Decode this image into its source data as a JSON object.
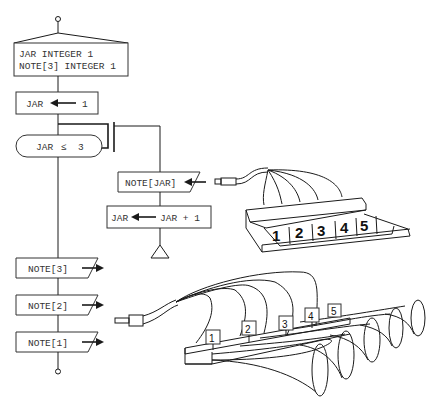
{
  "flowchart": {
    "declaration": {
      "line1": "JAR INTEGER 1",
      "line2": "NOTE[3] INTEGER 1"
    },
    "init": {
      "lhs": "JAR",
      "rhs": "1"
    },
    "loop_condition": {
      "lhs": "JAR",
      "op": "≤",
      "rhs": "3"
    },
    "input": {
      "label": "NOTE[JAR]"
    },
    "increment": {
      "lhs": "JAR",
      "rhs": "JAR + 1"
    },
    "outputs": [
      {
        "label": "NOTE[3]"
      },
      {
        "label": "NOTE[2]"
      },
      {
        "label": "NOTE[1]"
      }
    ]
  },
  "keypad": {
    "keys": [
      "1",
      "2",
      "3",
      "4",
      "5"
    ]
  },
  "horns": {
    "labels": [
      "1",
      "2",
      "3",
      "4",
      "5"
    ]
  },
  "colors": {
    "ink": "#1a1a1a",
    "text": "#333333",
    "background": "#ffffff"
  }
}
